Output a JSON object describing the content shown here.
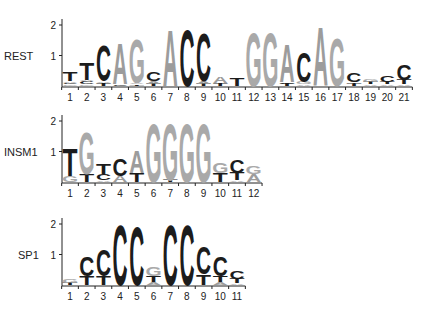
{
  "figure": {
    "type": "sequence-logo",
    "ylabel_ticks": [
      "1",
      "2"
    ]
  },
  "colors": {
    "C": "#1c1c1c",
    "T": "#1c1c1c",
    "G": "#a9a9a9",
    "A": "#9c9c9c",
    "axis": "#222222"
  },
  "chart_data": [
    {
      "type": "sequence-logo",
      "title": "REST",
      "ylabel": "bits",
      "ylim": [
        0,
        2
      ],
      "yticks": [
        1,
        2
      ],
      "positions": [
        "1",
        "2",
        "3",
        "4",
        "5",
        "6",
        "7",
        "8",
        "9",
        "10",
        "11",
        "12",
        "13",
        "14",
        "15",
        "16",
        "17",
        "18",
        "19",
        "20",
        "21"
      ],
      "stacks": [
        [
          {
            "l": "G",
            "h": 0.05
          },
          {
            "l": "C",
            "h": 0.05
          },
          {
            "l": "A",
            "h": 0.05
          },
          {
            "l": "T",
            "h": 0.3
          }
        ],
        [
          {
            "l": "G",
            "h": 0.05
          },
          {
            "l": "C",
            "h": 0.1
          },
          {
            "l": "A",
            "h": 0.05
          },
          {
            "l": "T",
            "h": 0.55
          }
        ],
        [
          {
            "l": "T",
            "h": 0.1
          },
          {
            "l": "A",
            "h": 0.05
          },
          {
            "l": "C",
            "h": 1.2
          }
        ],
        [
          {
            "l": "C",
            "h": 0.05
          },
          {
            "l": "A",
            "h": 1.35
          }
        ],
        [
          {
            "l": "T",
            "h": 0.05
          },
          {
            "l": "A",
            "h": 0.05
          },
          {
            "l": "G",
            "h": 1.5
          }
        ],
        [
          {
            "l": "T",
            "h": 0.07
          },
          {
            "l": "A",
            "h": 0.08
          },
          {
            "l": "C",
            "h": 0.3
          }
        ],
        [
          {
            "l": "A",
            "h": 1.9
          }
        ],
        [
          {
            "l": "C",
            "h": 1.9
          }
        ],
        [
          {
            "l": "T",
            "h": 0.08
          },
          {
            "l": "A",
            "h": 0.07
          },
          {
            "l": "C",
            "h": 1.6
          }
        ],
        [
          {
            "l": "T",
            "h": 0.1
          },
          {
            "l": "A",
            "h": 0.2
          }
        ],
        [
          {
            "l": "T",
            "h": 0.25
          }
        ],
        [
          {
            "l": "G",
            "h": 1.8
          }
        ],
        [
          {
            "l": "G",
            "h": 1.8
          }
        ],
        [
          {
            "l": "T",
            "h": 0.07
          },
          {
            "l": "C",
            "h": 0.05
          },
          {
            "l": "A",
            "h": 1.25
          }
        ],
        [
          {
            "l": "A",
            "h": 0.05
          },
          {
            "l": "G",
            "h": 0.08
          },
          {
            "l": "C",
            "h": 1.0
          }
        ],
        [
          {
            "l": "A",
            "h": 1.95
          }
        ],
        [
          {
            "l": "G",
            "h": 1.6
          }
        ],
        [
          {
            "l": "T",
            "h": 0.08
          },
          {
            "l": "A",
            "h": 0.05
          },
          {
            "l": "C",
            "h": 0.3
          }
        ],
        [
          {
            "l": "A",
            "h": 0.05
          },
          {
            "l": "T",
            "h": 0.08
          },
          {
            "l": "G",
            "h": 0.1
          }
        ],
        [
          {
            "l": "A",
            "h": 0.05
          },
          {
            "l": "T",
            "h": 0.08
          },
          {
            "l": "C",
            "h": 0.2
          }
        ],
        [
          {
            "l": "A",
            "h": 0.05
          },
          {
            "l": "T",
            "h": 0.15
          },
          {
            "l": "C",
            "h": 0.5
          }
        ]
      ]
    },
    {
      "type": "sequence-logo",
      "title": "INSM1",
      "ylabel": "bits",
      "ylim": [
        0,
        2
      ],
      "yticks": [
        1,
        2
      ],
      "positions": [
        "1",
        "2",
        "3",
        "4",
        "5",
        "6",
        "7",
        "8",
        "9",
        "10",
        "11",
        "12"
      ],
      "stacks": [
        [
          {
            "l": "G",
            "h": 0.2
          },
          {
            "l": "T",
            "h": 0.9
          }
        ],
        [
          {
            "l": "T",
            "h": 0.25
          },
          {
            "l": "G",
            "h": 1.4
          }
        ],
        [
          {
            "l": "A",
            "h": 0.05
          },
          {
            "l": "C",
            "h": 0.2
          },
          {
            "l": "T",
            "h": 0.35
          }
        ],
        [
          {
            "l": "A",
            "h": 0.2
          },
          {
            "l": "C",
            "h": 0.55
          }
        ],
        [
          {
            "l": "T",
            "h": 0.3
          },
          {
            "l": "A",
            "h": 0.75
          }
        ],
        [
          {
            "l": "G",
            "h": 1.95
          }
        ],
        [
          {
            "l": "T",
            "h": 0.07
          },
          {
            "l": "G",
            "h": 1.9
          }
        ],
        [
          {
            "l": "G",
            "h": 1.95
          }
        ],
        [
          {
            "l": "G",
            "h": 1.95
          }
        ],
        [
          {
            "l": "T",
            "h": 0.3
          },
          {
            "l": "G",
            "h": 0.35
          }
        ],
        [
          {
            "l": "A",
            "h": 0.05
          },
          {
            "l": "T",
            "h": 0.25
          },
          {
            "l": "C",
            "h": 0.45
          }
        ],
        [
          {
            "l": "A",
            "h": 0.25
          },
          {
            "l": "G",
            "h": 0.25
          }
        ]
      ]
    },
    {
      "type": "sequence-logo",
      "title": "SP1",
      "ylabel": "bits",
      "ylim": [
        0,
        2
      ],
      "yticks": [
        1,
        2
      ],
      "positions": [
        "1",
        "2",
        "3",
        "4",
        "5",
        "6",
        "7",
        "8",
        "9",
        "10",
        "11"
      ],
      "stacks": [
        [
          {
            "l": "T",
            "h": 0.08
          },
          {
            "l": "G",
            "h": 0.12
          }
        ],
        [
          {
            "l": "T",
            "h": 0.3
          },
          {
            "l": "C",
            "h": 0.65
          }
        ],
        [
          {
            "l": "T",
            "h": 0.3
          },
          {
            "l": "C",
            "h": 0.85
          }
        ],
        [
          {
            "l": "C",
            "h": 2.0
          }
        ],
        [
          {
            "l": "C",
            "h": 1.95
          }
        ],
        [
          {
            "l": "A",
            "h": 0.1
          },
          {
            "l": "T",
            "h": 0.2
          },
          {
            "l": "G",
            "h": 0.3
          }
        ],
        [
          {
            "l": "C",
            "h": 2.0
          }
        ],
        [
          {
            "l": "C",
            "h": 2.0
          }
        ],
        [
          {
            "l": "T",
            "h": 0.35
          },
          {
            "l": "C",
            "h": 0.9
          }
        ],
        [
          {
            "l": "A",
            "h": 0.1
          },
          {
            "l": "T",
            "h": 0.2
          },
          {
            "l": "C",
            "h": 0.65
          }
        ],
        [
          {
            "l": "A",
            "h": 0.05
          },
          {
            "l": "T",
            "h": 0.15
          },
          {
            "l": "C",
            "h": 0.25
          }
        ]
      ]
    }
  ]
}
